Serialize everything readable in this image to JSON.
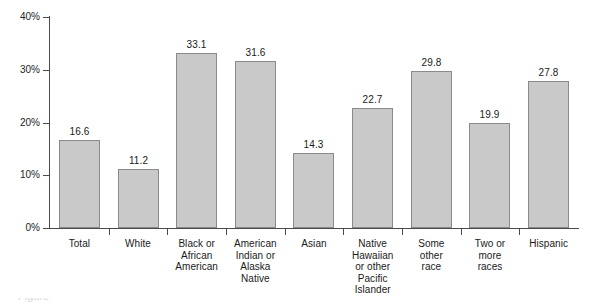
{
  "chart_data": {
    "type": "bar",
    "title": "",
    "subtitle": "",
    "xlabel": "",
    "ylabel": "",
    "ylim": [
      0,
      40
    ],
    "ytick_labels": [
      "40%",
      "30%",
      "20%",
      "10%",
      "0%"
    ],
    "ytick_values": [
      40,
      30,
      20,
      10,
      0
    ],
    "grid": false,
    "legend": "none",
    "value_label_format": "one-decimal",
    "categories": [
      "Total",
      "Black or African American",
      "American Indian or Alaska Native",
      "Asian",
      "Native Hawaiian or other Pacific Islander",
      "Some other race",
      "Two or more races",
      "Hispanic",
      "White"
    ],
    "bars": [
      {
        "category": "Total",
        "label_lines": [
          "Total"
        ],
        "value": 16.6,
        "value_label": "16.6"
      },
      {
        "category": "White",
        "label_lines": [
          "White"
        ],
        "value": 11.2,
        "value_label": "11.2"
      },
      {
        "category": "Black or African American",
        "label_lines": [
          "Black or",
          "African",
          "American"
        ],
        "value": 33.1,
        "value_label": "33.1"
      },
      {
        "category": "American Indian or Alaska Native",
        "label_lines": [
          "American",
          "Indian or",
          "Alaska",
          "Native"
        ],
        "value": 31.6,
        "value_label": "31.6"
      },
      {
        "category": "Asian",
        "label_lines": [
          "Asian"
        ],
        "value": 14.3,
        "value_label": "14.3"
      },
      {
        "category": "Native Hawaiian or other Pacific Islander",
        "label_lines": [
          "Native",
          "Hawaiian",
          "or other",
          "Pacific",
          "Islander"
        ],
        "value": 22.7,
        "value_label": "22.7"
      },
      {
        "category": "Some other race",
        "label_lines": [
          "Some",
          "other",
          "race"
        ],
        "value": 29.8,
        "value_label": "29.8"
      },
      {
        "category": "Two or more races",
        "label_lines": [
          "Two or",
          "more",
          "races"
        ],
        "value": 19.9,
        "value_label": "19.9"
      },
      {
        "category": "Hispanic",
        "label_lines": [
          "Hispanic"
        ],
        "value": 27.8,
        "value_label": "27.8"
      }
    ],
    "colors": {
      "bar_fill": "#c9c9c9",
      "bar_border": "#8a8a8a",
      "axis": "#4a4a4a",
      "text": "#1a1a1a",
      "background": "#ffffff"
    }
  },
  "caption": {
    "cutoff_text": "Figure"
  }
}
